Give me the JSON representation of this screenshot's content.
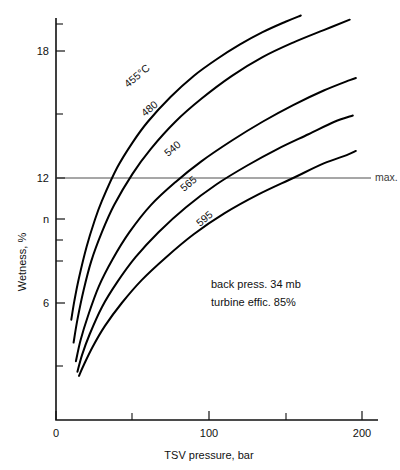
{
  "chart_data": {
    "type": "line",
    "title": "",
    "xlabel": "TSV pressure, bar",
    "ylabel": "Wetness, %",
    "xlim": [
      0,
      205
    ],
    "ylim": [
      0,
      20.4
    ],
    "grid": false,
    "legend": "inline-curve-labels",
    "x_ticks_major": [
      0,
      100,
      200
    ],
    "x_tick_labels": [
      "0",
      "100",
      "200"
    ],
    "x_ticks_minor": [
      50,
      150
    ],
    "y_ticks_major": [
      6,
      9,
      12,
      18
    ],
    "y_tick_labels": [
      "6",
      "n",
      "12",
      "18"
    ],
    "y_ticks_minor": [
      3,
      7.5,
      10.5,
      15,
      19.5
    ],
    "reference_lines": [
      {
        "name": "max-wetness",
        "axis": "y",
        "value": 12,
        "label": "max."
      }
    ],
    "annotations": [
      {
        "name": "back-pressure-note",
        "text": "back press. 34 mb",
        "x": 95,
        "y": 6.4
      },
      {
        "name": "turbine-efficiency-note",
        "text": "turbine effic. 85%",
        "x": 95,
        "y": 5.4
      }
    ],
    "series": [
      {
        "name": "455C",
        "label": "455°C",
        "label_x": 47,
        "label_y": 16.6,
        "points": [
          [
            10.0,
            5.2
          ],
          [
            12.0,
            6.1
          ],
          [
            15.0,
            7.2
          ],
          [
            20.0,
            8.7
          ],
          [
            25.0,
            9.9
          ],
          [
            30.0,
            10.9
          ],
          [
            40.0,
            12.5
          ],
          [
            50.0,
            13.7
          ],
          [
            60.0,
            14.7
          ],
          [
            75.0,
            15.9
          ],
          [
            90.0,
            16.9
          ],
          [
            105.0,
            17.7
          ],
          [
            120.0,
            18.4
          ],
          [
            135.0,
            19.0
          ],
          [
            150.0,
            19.5
          ],
          [
            160.0,
            19.8
          ]
        ]
      },
      {
        "name": "480",
        "label": "480",
        "label_x": 57,
        "label_y": 15.0,
        "points": [
          [
            11.5,
            4.1
          ],
          [
            14.0,
            5.2
          ],
          [
            18.0,
            6.6
          ],
          [
            23.0,
            8.0
          ],
          [
            30.0,
            9.4
          ],
          [
            38.0,
            10.7
          ],
          [
            50.0,
            12.2
          ],
          [
            62.0,
            13.4
          ],
          [
            78.0,
            14.7
          ],
          [
            95.0,
            15.8
          ],
          [
            115.0,
            16.9
          ],
          [
            135.0,
            17.8
          ],
          [
            155.0,
            18.5
          ],
          [
            175.0,
            19.1
          ],
          [
            192.0,
            19.6
          ]
        ]
      },
      {
        "name": "540",
        "label": "540",
        "label_x": 72,
        "label_y": 12.7,
        "points": [
          [
            13.0,
            3.2
          ],
          [
            16.0,
            4.2
          ],
          [
            21.0,
            5.4
          ],
          [
            28.0,
            6.8
          ],
          [
            37.0,
            8.1
          ],
          [
            48.0,
            9.4
          ],
          [
            62.0,
            10.7
          ],
          [
            78.0,
            11.8
          ],
          [
            95.0,
            12.8
          ],
          [
            115.0,
            13.8
          ],
          [
            135.0,
            14.7
          ],
          [
            155.0,
            15.5
          ],
          [
            175.0,
            16.2
          ],
          [
            192.0,
            16.7
          ],
          [
            196.0,
            16.8
          ]
        ]
      },
      {
        "name": "565",
        "label": "565",
        "label_x": 83,
        "label_y": 11.0,
        "points": [
          [
            14.0,
            2.7
          ],
          [
            17.0,
            3.5
          ],
          [
            22.0,
            4.5
          ],
          [
            30.0,
            5.8
          ],
          [
            40.0,
            7.0
          ],
          [
            52.0,
            8.2
          ],
          [
            67.0,
            9.4
          ],
          [
            85.0,
            10.6
          ],
          [
            105.0,
            11.7
          ],
          [
            125.0,
            12.6
          ],
          [
            145.0,
            13.4
          ],
          [
            165.0,
            14.1
          ],
          [
            182.0,
            14.7
          ],
          [
            194.0,
            15.0
          ]
        ]
      },
      {
        "name": "595",
        "label": "595",
        "label_x": 93,
        "label_y": 9.1,
        "points": [
          [
            15.0,
            2.5
          ],
          [
            18.0,
            3.0
          ],
          [
            24.0,
            3.9
          ],
          [
            32.0,
            4.9
          ],
          [
            43.0,
            6.0
          ],
          [
            56.0,
            7.1
          ],
          [
            72.0,
            8.2
          ],
          [
            90.0,
            9.3
          ],
          [
            110.0,
            10.3
          ],
          [
            132.0,
            11.2
          ],
          [
            155.0,
            12.0
          ],
          [
            175.0,
            12.7
          ],
          [
            190.0,
            13.1
          ],
          [
            196.0,
            13.3
          ]
        ]
      }
    ]
  },
  "axis": {
    "y_label": "Wetness, %",
    "x_label": "TSV pressure, bar",
    "y_tick_18": "18",
    "y_tick_12": "12",
    "y_tick_9": "n",
    "y_tick_6": "6",
    "x_tick_0": "0",
    "x_tick_100": "100",
    "x_tick_200": "200"
  },
  "labels": {
    "curve_455": "455°C",
    "curve_480": "480",
    "curve_540": "540",
    "curve_565": "565",
    "curve_595": "595",
    "max_line": "max.",
    "note_back_press": "back press. 34 mb",
    "note_turbine_effic": "turbine effic. 85%"
  },
  "colors": {
    "curve": "#000000",
    "axis": "#111111",
    "reference_line": "#3a3a3a",
    "background": "#ffffff"
  }
}
